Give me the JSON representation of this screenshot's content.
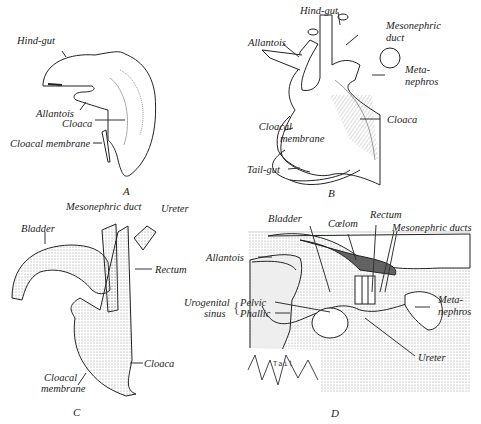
{
  "figure": {
    "panels": [
      {
        "id": "A",
        "caption": "A",
        "labels": {
          "hind_gut": "Hind-gut",
          "allantois": "Allantois",
          "cloaca": "Cloaca",
          "cloacal_membrane": "Cloacal membrane"
        }
      },
      {
        "id": "B",
        "caption": "B",
        "labels": {
          "hind_gut": "Hind-gut",
          "mesonephric_duct_1": "Mesonephric",
          "mesonephric_duct_2": "duct",
          "allantois": "Allantois",
          "metanephros_1": "Meta-",
          "metanephros_2": "nephros",
          "cloaca": "Cloaca",
          "cloacal_membrane_1": "Cloacal",
          "cloacal_membrane_2": "membrane",
          "tail_gut": "Tail-gut"
        }
      },
      {
        "id": "C",
        "caption": "C",
        "labels": {
          "mesonephric_duct": "Mesonephric duct",
          "ureter": "Ureter",
          "bladder": "Bladder",
          "rectum": "Rectum",
          "cloaca": "Cloaca",
          "cloacal_membrane_1": "Cloacal",
          "cloacal_membrane_2": "membrane"
        }
      },
      {
        "id": "D",
        "caption": "D",
        "labels": {
          "bladder": "Bladder",
          "coelom": "Cœlom",
          "rectum": "Rectum",
          "mesonephric_ducts": "Mesonephric ducts",
          "allantois": "Allantois",
          "urogenital_1": "Urogenital",
          "urogenital_2": "sinus",
          "pelvic": "Pelvic",
          "phallic": "Phallic",
          "metanephros_1": "Meta-",
          "metanephros_2": "nephros",
          "ureter": "Ureter",
          "tail": "Tail"
        }
      }
    ]
  }
}
